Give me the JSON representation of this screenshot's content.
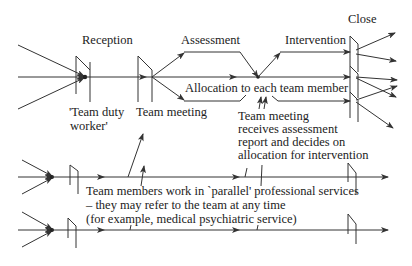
{
  "diagram": {
    "type": "process-flow",
    "stages": [
      {
        "id": "reception",
        "label": "Reception"
      },
      {
        "id": "assessment",
        "label": "Assessment"
      },
      {
        "id": "intervention",
        "label": "Intervention"
      },
      {
        "id": "close",
        "label": "Close"
      }
    ],
    "annotations": {
      "duty_worker_line1": "'Team duty",
      "duty_worker_line2": "worker'",
      "team_meeting": "Team meeting",
      "allocation": "Allocation to each team member",
      "tm_receives_1": "Team meeting",
      "tm_receives_2": "receives assessment",
      "tm_receives_3": "report and decides on",
      "tm_receives_4": "allocation for intervention",
      "parallel_1": "Team members work in `parallel' professional services",
      "parallel_2": "– they may refer to the team at any time",
      "parallel_3": "(for example, medical psychiatric service)"
    },
    "colors": {
      "line": "#333333",
      "text": "#222222",
      "background": "#ffffff"
    }
  }
}
